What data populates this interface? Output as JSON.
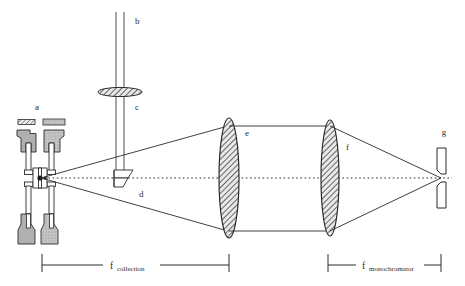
{
  "figure": {
    "background": "#ffffff",
    "ink": "#1a1a1a",
    "metal_fill": "#b0b0b0",
    "hatch_fill": "#d8d8d8"
  },
  "labels": {
    "a": "a",
    "b": "b",
    "c": "c",
    "d": "d",
    "e": "e",
    "f": "f",
    "g": "g"
  },
  "dimensions": [
    {
      "symbol": "f",
      "subscript": "collection"
    },
    {
      "symbol": "f",
      "subscript": "monochromator"
    }
  ],
  "components": {
    "cell": "diamond-anvil-cell",
    "excitation_beam": "vertical-laser-beam",
    "focus_lens": "excitation-focusing-lens",
    "prism": "turning-prism",
    "collection_lens": "collection-lens",
    "monochromator_lens": "monochromator-lens",
    "slit": "entrance-slit",
    "axis": "optical-axis"
  }
}
